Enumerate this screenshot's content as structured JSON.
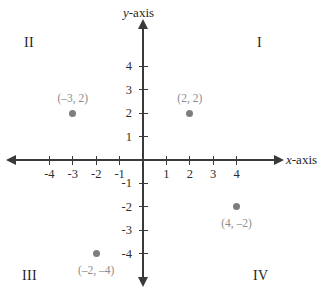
{
  "chart_data": {
    "type": "scatter",
    "title": "",
    "xlabel": "x-axis",
    "ylabel": "y-axis",
    "xlim": [
      -5,
      5
    ],
    "ylim": [
      -5,
      5
    ],
    "grid": false,
    "legend": "none",
    "x_ticks": [
      "-4",
      "-3",
      "-2",
      "-1",
      "1",
      "2",
      "3",
      "4"
    ],
    "y_ticks": [
      "4",
      "3",
      "2",
      "1",
      "-1",
      "-2",
      "-3",
      "-4"
    ],
    "points": [
      {
        "label": "(–3, 2)",
        "x": -3,
        "y": 2,
        "label_position": "above"
      },
      {
        "label": "(2, 2)",
        "x": 2,
        "y": 2,
        "label_position": "above"
      },
      {
        "label": "(4, –2)",
        "x": 4,
        "y": -2,
        "label_position": "below"
      },
      {
        "label": "(–2, –4)",
        "x": -2,
        "y": -4,
        "label_position": "below"
      }
    ],
    "quadrants": [
      {
        "name": "I",
        "position": "top-right"
      },
      {
        "name": "II",
        "position": "top-left"
      },
      {
        "name": "III",
        "position": "bottom-left"
      },
      {
        "name": "IV",
        "position": "bottom-right"
      }
    ]
  },
  "axis_labels": {
    "x_variable": "x",
    "x_suffix": "-axis",
    "y_variable": "y",
    "y_suffix": "-axis"
  },
  "colors": {
    "axis": "#3a3a3a",
    "tick_text": "#2e2e2e",
    "point": "#7d7d7d",
    "point_label": "#8d8d8d",
    "background": "#ffffff"
  }
}
